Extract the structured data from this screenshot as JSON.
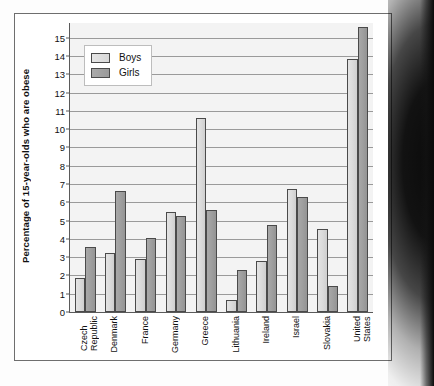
{
  "chart_data": {
    "type": "bar",
    "title": "",
    "xlabel": "",
    "ylabel": "Percentage of 15-year-olds who are obese",
    "ylim": [
      0,
      15.8
    ],
    "ytick_labels": [
      "0",
      "1",
      "2",
      "3",
      "4",
      "5",
      "6",
      "7",
      "8",
      "9",
      "10",
      "11",
      "12",
      "13",
      "14",
      "15"
    ],
    "ytick_values": [
      0,
      1,
      2,
      3,
      4,
      5,
      6,
      7,
      8,
      9,
      10,
      11,
      12,
      13,
      14,
      15
    ],
    "grid": true,
    "legend_position": "upper-left-inside",
    "categories": [
      "Czech\nRepublic",
      "Denmark",
      "France",
      "Germany",
      "Greece",
      "Lithuania",
      "Ireland",
      "Israel",
      "Slovakia",
      "United\nStates"
    ],
    "series": [
      {
        "name": "Boys",
        "color": "#dcdcdc",
        "values": [
          1.85,
          3.25,
          2.9,
          5.45,
          10.6,
          0.65,
          2.8,
          6.75,
          4.55,
          13.85
        ]
      },
      {
        "name": "Girls",
        "color": "#a0a0a0",
        "values": [
          3.55,
          6.6,
          4.05,
          5.25,
          5.6,
          2.3,
          4.75,
          6.3,
          1.4,
          15.6
        ]
      }
    ]
  },
  "figure": {
    "frame_color": "#6e6e6e",
    "plot_background": "#f3f3f3",
    "gridline_color": "#9a9a9a",
    "axis_color": "#5a5a5a"
  }
}
